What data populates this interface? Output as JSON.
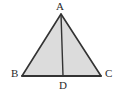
{
  "figure": {
    "type": "geometry-diagram",
    "shape": "triangle-with-cevian",
    "background_color": "#ffffff",
    "fill_color": "#dcdcdc",
    "stroke_color": "#333333",
    "label_color": "#2b2b2b",
    "stroke_width": 1.6,
    "canvas": {
      "width": 122,
      "height": 97
    },
    "points": {
      "A": {
        "x": 61,
        "y": 14,
        "label": "A"
      },
      "B": {
        "x": 22,
        "y": 76,
        "label": "B"
      },
      "C": {
        "x": 101,
        "y": 76,
        "label": "C"
      },
      "D": {
        "x": 63,
        "y": 76,
        "label": "D"
      }
    },
    "polygon_points": "61,14 101,76 22,76",
    "segments": [
      {
        "name": "AB",
        "from": "A",
        "to": "B"
      },
      {
        "name": "BC",
        "from": "B",
        "to": "C"
      },
      {
        "name": "CA",
        "from": "C",
        "to": "A"
      },
      {
        "name": "AD",
        "from": "A",
        "to": "D"
      }
    ],
    "labels": {
      "A": "A",
      "B": "B",
      "C": "C",
      "D": "D"
    }
  }
}
